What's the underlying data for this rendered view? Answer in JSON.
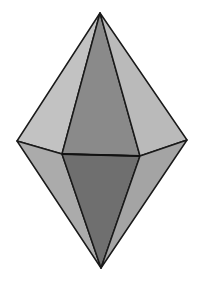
{
  "diagram": {
    "shape": "hexagonal-bipyramid",
    "colors": {
      "background": "#ffffff",
      "edge": "#1a1a1a",
      "upper_side_face": "#bdbdbd",
      "upper_front_face": "#8a8a8a",
      "lower_side_face": "#a9a9a9",
      "lower_front_face": "#6f6f6f"
    },
    "vertices": {
      "top": [
        100,
        13
      ],
      "bottom": [
        101,
        268
      ],
      "left": [
        17,
        141
      ],
      "right": [
        187,
        140
      ],
      "front_left": [
        62,
        154
      ],
      "front_right": [
        140,
        156
      ]
    }
  }
}
